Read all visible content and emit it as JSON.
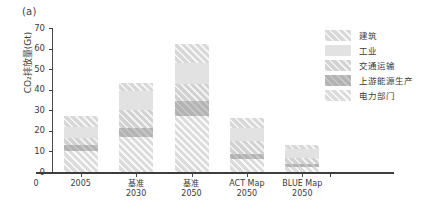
{
  "figure": {
    "panel_label": "(a)"
  },
  "chart_data": {
    "type": "bar",
    "subtype": "stacked-bar",
    "title": "",
    "xlabel": "",
    "ylabel": "CO₂排放量(Gt)",
    "ylim": [
      0,
      70
    ],
    "yticks": [
      0,
      10,
      20,
      30,
      40,
      50,
      60,
      70
    ],
    "ytick_labels": [
      "0",
      "10",
      "20",
      "30",
      "40",
      "50",
      "60",
      "70"
    ],
    "grid": false,
    "legend_position": "right",
    "origin_label": "0",
    "categories": [
      "2005",
      "基准\n2030",
      "基准\n2050",
      "ACT Map\n2050",
      "BLUE Map\n2050"
    ],
    "category_lines": [
      {
        "line1": "2005",
        "line2": ""
      },
      {
        "line1": "基准",
        "line2": "2030"
      },
      {
        "line1": "基准",
        "line2": "2050"
      },
      {
        "line1": "ACT Map",
        "line2": "2050"
      },
      {
        "line1": "BLUE Map",
        "line2": "2050"
      }
    ],
    "series": [
      {
        "name": "电力部门",
        "key": "power",
        "values": [
          10.0,
          17.0,
          27.0,
          6.5,
          2.5
        ]
      },
      {
        "name": "上游能源生产",
        "key": "upstream",
        "values": [
          3.0,
          4.5,
          7.5,
          2.5,
          1.5
        ]
      },
      {
        "name": "交通运输",
        "key": "transport",
        "values": [
          3.5,
          8.5,
          8.5,
          6.0,
          3.0
        ]
      },
      {
        "name": "工业",
        "key": "industry",
        "values": [
          5.5,
          9.5,
          10.0,
          6.5,
          4.0
        ]
      },
      {
        "name": "建筑",
        "key": "buildings",
        "values": [
          5.0,
          4.0,
          9.0,
          5.0,
          2.0
        ]
      }
    ],
    "totals": [
      27.0,
      43.5,
      62.0,
      26.5,
      13.0
    ]
  },
  "legend": {
    "items": [
      {
        "label": "建筑",
        "key": "buildings"
      },
      {
        "label": "工业",
        "key": "industry"
      },
      {
        "label": "交通运输",
        "key": "transport"
      },
      {
        "label": "上游能源生产",
        "key": "upstream"
      },
      {
        "label": "电力部门",
        "key": "power"
      }
    ]
  },
  "colors": {
    "buildings": "#d8d8d8",
    "industry": "#e2e2e2",
    "transport": "#d2d2d2",
    "upstream": "#b3b3b3",
    "power": "#dcdcdc",
    "axis": "#3d3d3d",
    "text": "#3a3a3a"
  }
}
